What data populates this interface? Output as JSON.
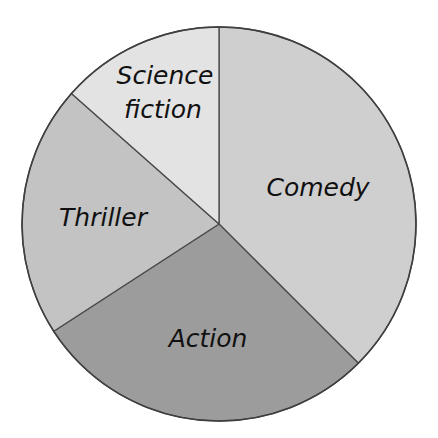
{
  "chart_data": {
    "type": "pie",
    "title": "",
    "xlabel": "",
    "ylabel": "",
    "start_angle_deg": 0,
    "direction": "clockwise",
    "categories": [
      "Comedy",
      "Action",
      "Thriller",
      "Science fiction"
    ],
    "values": [
      37.5,
      28.3,
      20.7,
      13.5
    ],
    "value_unit": "percent (estimated from slice angles)",
    "slices": [
      {
        "label": "Comedy",
        "label_lines": [
          "Comedy"
        ],
        "value": 37.5,
        "start_deg": 0,
        "end_deg": 135,
        "color": "#cfcfcf"
      },
      {
        "label": "Action",
        "label_lines": [
          "Action"
        ],
        "value": 28.3,
        "start_deg": 135,
        "end_deg": 237,
        "color": "#9c9c9c"
      },
      {
        "label": "Thriller",
        "label_lines": [
          "Thriller"
        ],
        "value": 20.7,
        "start_deg": 237,
        "end_deg": 311.5,
        "color": "#c3c3c3"
      },
      {
        "label": "Science fiction",
        "label_lines": [
          "Science",
          "fiction"
        ],
        "value": 13.5,
        "start_deg": 311.5,
        "end_deg": 360,
        "color": "#e3e3e3"
      }
    ],
    "legend": {
      "visible": false,
      "position": "none"
    },
    "data_labels": "inside slices, category names only",
    "grid": false
  },
  "labels": {
    "comedy": "Comedy",
    "action": "Action",
    "thriller": "Thriller",
    "scifi_line1": "Science",
    "scifi_line2": "fiction"
  },
  "colors": {
    "comedy": "#cfcfcf",
    "action": "#9c9c9c",
    "thriller": "#c3c3c3",
    "science_fiction": "#e3e3e3",
    "outline": "#3f3f3f",
    "text": "#111111"
  }
}
